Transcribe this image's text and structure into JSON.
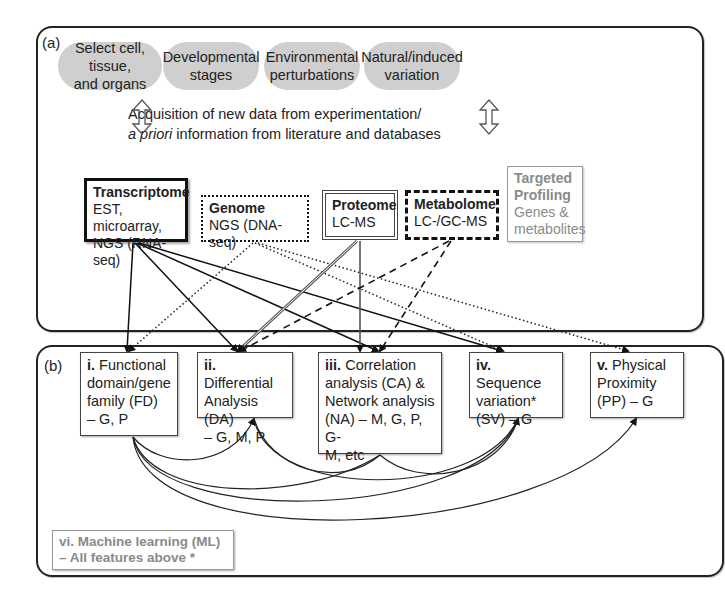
{
  "panel_a": {
    "label": "(a)",
    "sources": [
      {
        "line1": "Select cell, tissue,",
        "line2": "and organs"
      },
      {
        "line1": "Developmental",
        "line2": "stages"
      },
      {
        "line1": "Environmental",
        "line2": "perturbations"
      },
      {
        "line1": "Natural/induced",
        "line2": "variation"
      }
    ],
    "acquisition": {
      "line1": "Acquisition of new data from experimentation/",
      "line2_italic": "a priori",
      "line2_rest": " information from literature and databases"
    },
    "omics": [
      {
        "title": "Transcriptome",
        "line1": "EST, microarray,",
        "line2": "NGS (RNA-seq)",
        "border": "thick-solid"
      },
      {
        "title": "Genome",
        "line1": "NGS (DNA-seq)",
        "line2": "",
        "border": "dotted"
      },
      {
        "title": "Proteome",
        "line1": "LC-MS",
        "line2": "",
        "border": "double"
      },
      {
        "title": "Metabolome",
        "line1": "LC-/GC-MS",
        "line2": "",
        "border": "dashed"
      },
      {
        "title": "Targeted",
        "title2": "Profiling",
        "line1": "Genes &",
        "line2": "metabolites",
        "border": "grey"
      }
    ]
  },
  "panel_b": {
    "label": "(b)",
    "analyses": [
      {
        "num": "i.",
        "lines": [
          " Functional",
          "domain/gene",
          "family (FD)",
          "– G, P"
        ]
      },
      {
        "num": "ii.",
        "lines": [
          " Differential",
          "Analysis (DA)",
          "– G, M, P"
        ]
      },
      {
        "num": "iii.",
        "lines": [
          " Correlation",
          "analysis (CA) &",
          "Network analysis",
          "(NA) – M, G, P, G-",
          "M, etc"
        ]
      },
      {
        "num": "iv.",
        "lines": [
          " Sequence",
          "variation*",
          "(SV) – G"
        ]
      },
      {
        "num": "v.",
        "lines": [
          " Physical",
          "Proximity",
          "(PP) – G"
        ]
      }
    ],
    "ml": {
      "line1": "vi. Machine learning (ML)",
      "line2": "– All features above *"
    }
  },
  "colors": {
    "pill_fill": "#cfcfcf",
    "line": "#222222",
    "proteome_line": "#555555",
    "grey_text": "#8a8a8a"
  }
}
